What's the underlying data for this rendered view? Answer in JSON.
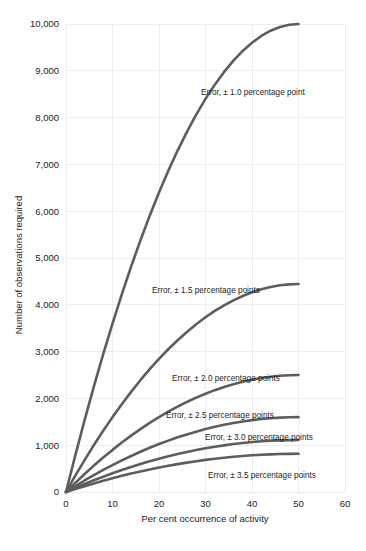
{
  "chart_data": {
    "type": "line",
    "title": "",
    "xlabel": "Per cent occurrence of activity",
    "ylabel": "Number of observations required",
    "xlim": [
      0,
      60
    ],
    "ylim": [
      0,
      10000
    ],
    "xticks": [
      "0",
      "10",
      "20",
      "30",
      "40",
      "50",
      "60"
    ],
    "xtick_values": [
      0,
      10,
      20,
      30,
      40,
      50,
      60
    ],
    "yticks": [
      "0",
      "1,000",
      "2,000",
      "3,000",
      "4,000",
      "5,000",
      "6,000",
      "7,000",
      "8,000",
      "9,000",
      "10,000"
    ],
    "ytick_values": [
      0,
      1000,
      2000,
      3000,
      4000,
      5000,
      6000,
      7000,
      8000,
      9000,
      10000
    ],
    "grid": true,
    "legend_position": "inline-annotations",
    "x": [
      0,
      2,
      4,
      6,
      8,
      10,
      12,
      14,
      16,
      18,
      20,
      22,
      24,
      26,
      28,
      30,
      32,
      34,
      36,
      38,
      40,
      42,
      44,
      46,
      48,
      50
    ],
    "series": [
      {
        "name": "Error, ± 1.0 percentage point",
        "error": 1.0,
        "label": "Error,  ± 1.0 percentage point",
        "values": [
          0,
          784,
          1536,
          2256,
          2944,
          3600,
          4224,
          4816,
          5376,
          5904,
          6400,
          6864,
          7296,
          7696,
          8064,
          8400,
          8704,
          8976,
          9216,
          9424,
          9600,
          9744,
          9856,
          9936,
          9984,
          10000
        ],
        "endpoint": 10000
      },
      {
        "name": "Error, ± 1.5 percentage points",
        "error": 1.5,
        "label": "Error,  ± 1.5 percentage points",
        "values": [
          0,
          348,
          683,
          1003,
          1308,
          1600,
          1877,
          2140,
          2389,
          2624,
          2844,
          3050,
          3242,
          3420,
          3584,
          3733,
          3869,
          3989,
          4096,
          4189,
          4267,
          4331,
          4380,
          4416,
          4437,
          4444
        ],
        "endpoint": 4444
      },
      {
        "name": "Error, ± 2.0 percentage points",
        "error": 2.0,
        "label": "Error,  ± 2.0 percentage points",
        "values": [
          0,
          196,
          384,
          564,
          736,
          900,
          1056,
          1204,
          1344,
          1476,
          1600,
          1716,
          1824,
          1924,
          2016,
          2100,
          2176,
          2244,
          2304,
          2356,
          2400,
          2436,
          2464,
          2484,
          2496,
          2500
        ],
        "endpoint": 2500
      },
      {
        "name": "Error, ± 2.5 percentage points",
        "error": 2.5,
        "label": "Error,  ± 2.5 percentage points",
        "values": [
          0,
          125,
          246,
          361,
          471,
          576,
          676,
          770,
          860,
          944,
          1024,
          1098,
          1168,
          1231,
          1290,
          1344,
          1393,
          1436,
          1475,
          1508,
          1536,
          1559,
          1577,
          1590,
          1597,
          1600
        ],
        "endpoint": 1600
      },
      {
        "name": "Error, ± 3.0 percentage points",
        "error": 3.0,
        "label": "Error,  ± 3.0 percentage points",
        "values": [
          0,
          87,
          171,
          251,
          327,
          400,
          469,
          535,
          597,
          656,
          711,
          763,
          811,
          855,
          896,
          933,
          967,
          997,
          1024,
          1047,
          1067,
          1083,
          1095,
          1104,
          1109,
          1111
        ],
        "endpoint": 1111
      },
      {
        "name": "Error, ± 3.5 percentage points",
        "error": 3.5,
        "label": "Error,  ± 3.5 percentage points",
        "values": [
          0,
          64,
          125,
          184,
          240,
          294,
          345,
          393,
          439,
          482,
          522,
          560,
          596,
          628,
          658,
          686,
          710,
          733,
          752,
          769,
          784,
          796,
          805,
          811,
          815,
          816
        ],
        "endpoint": 816
      }
    ],
    "annotations": [
      {
        "text": "Error,  ± 1.0 percentage point",
        "x_px": 201,
        "y_px": 95
      },
      {
        "text": "Error,  ± 1.5 percentage points",
        "x_px": 152,
        "y_px": 293
      },
      {
        "text": "Error,  ± 2.0 percentage points",
        "x_px": 172,
        "y_px": 381
      },
      {
        "text": "Error,  ± 2.5 percentage points",
        "x_px": 166,
        "y_px": 418
      },
      {
        "text": "Error,  ± 3.0 percentage points",
        "x_px": 205,
        "y_px": 440
      },
      {
        "text": "Error,  ± 3.5 percentage points",
        "x_px": 208,
        "y_px": 478
      }
    ],
    "colors": {
      "curve": "#5d5d5d",
      "grid": "#ededed",
      "text": "#1a1a1a",
      "background": "#ffffff"
    }
  },
  "caption": {
    "text": ""
  }
}
